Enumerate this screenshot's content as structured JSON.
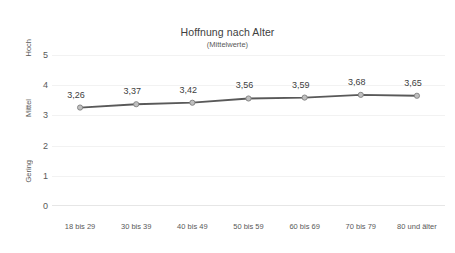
{
  "chart_data": {
    "type": "line",
    "title": "Hoffnung nach Alter",
    "subtitle": "(Mittelwerte)",
    "xlabel": "",
    "ylabel": "",
    "categories": [
      "18 bis 29",
      "30 bis 39",
      "40 bis 49",
      "50 bis 59",
      "60 bis 69",
      "70 bis 79",
      "80 und älter"
    ],
    "values": [
      3.26,
      3.37,
      3.42,
      3.56,
      3.59,
      3.68,
      3.65
    ],
    "value_labels": [
      "3,26",
      "3,37",
      "3,42",
      "3,56",
      "3,59",
      "3,68",
      "3,65"
    ],
    "ylim": [
      0,
      5
    ],
    "y_ticks": [
      0,
      1,
      2,
      3,
      4,
      5
    ],
    "y_tick_labels": [
      "0",
      "1",
      "2",
      "3",
      "4",
      "5"
    ],
    "y_category_labels": [
      {
        "text": "Hoch",
        "at_value": 5
      },
      {
        "text": "Mittel",
        "at_value": 3
      },
      {
        "text": "Gering",
        "at_value": 1
      }
    ],
    "grid": true,
    "legend": false,
    "series_name": "Hoffnung",
    "colors": {
      "line": "#595959",
      "marker_fill": "#bfbfbf",
      "marker_stroke": "#808080",
      "text": "#404040",
      "tick_text": "#595959",
      "gridline": "#f2f2f2",
      "background": "#ffffff"
    }
  }
}
